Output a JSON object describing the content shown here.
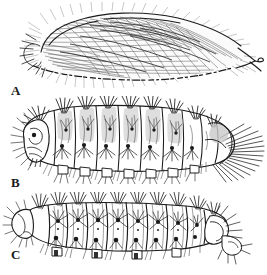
{
  "figure": {
    "type": "scientific-illustration-plate",
    "background_color": "#ffffff",
    "ink_color": "#1b1b1b",
    "width": 267,
    "height": 275,
    "panel_count": 3,
    "panels": [
      {
        "id": "A",
        "label": "A",
        "subject": "hairy-cocoon",
        "description": "Elongate teardrop-shaped silken cocoon densely covered with long fine hairs, blunt at left, drawn to a fine point with a small recurved hook at right",
        "orientation": "lateral",
        "label_position": {
          "x": 11,
          "y": 84
        },
        "bounds": {
          "x": 12,
          "y": 4,
          "width": 248,
          "height": 80
        }
      },
      {
        "id": "B",
        "label": "B",
        "subject": "larva-lateral",
        "description": "Lateral view of a hairy caterpillar larva showing head capsule at left, twelve body segments with dorsal setal tufts, lateral verrucae bearing setae, thoracic legs and abdominal prolegs along the venter, and a radiating terminal setal fan at the rear",
        "orientation": "lateral",
        "segment_count": 12,
        "label_position": {
          "x": 11,
          "y": 180
        },
        "bounds": {
          "x": 14,
          "y": 100,
          "width": 246,
          "height": 80
        }
      },
      {
        "id": "C",
        "label": "C",
        "subject": "larva-dorsal",
        "description": "Dorsolateral view of a caterpillar larva with rounded head at left, series of rectangular body segments each bearing paired dorsal setal tufts and dark pinacula, small ventral prolegs, and an angular terminal segment at right",
        "orientation": "dorsal",
        "segment_count": 11,
        "label_position": {
          "x": 11,
          "y": 248
        },
        "bounds": {
          "x": 16,
          "y": 196,
          "width": 232,
          "height": 58
        }
      }
    ]
  }
}
